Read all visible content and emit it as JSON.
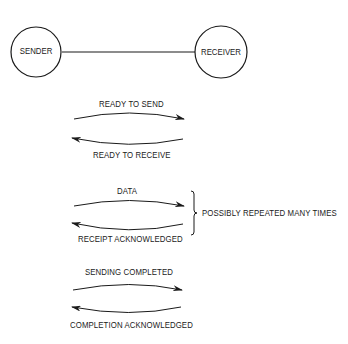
{
  "nodes": {
    "sender": {
      "label": "SENDER"
    },
    "receiver": {
      "label": "RECEIVER"
    }
  },
  "exchanges": [
    {
      "forward_label": "READY TO SEND",
      "backward_label": "READY TO RECEIVE"
    },
    {
      "forward_label": "DATA",
      "backward_label": "RECEIPT ACKNOWLEDGED"
    },
    {
      "forward_label": "SENDING COMPLETED",
      "backward_label": "COMPLETION ACKNOWLEDGED"
    }
  ],
  "brace_note": "POSSIBLY REPEATED MANY TIMES",
  "colors": {
    "ink": "#1a1a1a",
    "background": "#ffffff"
  }
}
